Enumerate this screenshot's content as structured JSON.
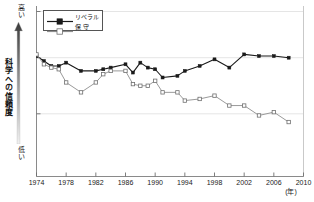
{
  "chart_data": {
    "type": "line",
    "title": "",
    "xlabel": "(年)",
    "ylabel": "科学への信頼度",
    "ylabel_high": "高い",
    "ylabel_low": "低い",
    "xlim": [
      1974,
      2010
    ],
    "ylim": [
      0,
      100
    ],
    "grid": true,
    "gridlines_y": [
      100,
      72,
      38
    ],
    "legend_position": "top-left",
    "xticks": [
      "1974",
      "1978",
      "1982",
      "1986",
      "1990",
      "1994",
      "1998",
      "2002",
      "2006",
      "2010"
    ],
    "xtick_values": [
      1974,
      1978,
      1982,
      1986,
      1990,
      1994,
      1998,
      2002,
      2006,
      2010
    ],
    "series": [
      {
        "name": "リベラル",
        "color": "#1a1a1a",
        "marker": "filled-square",
        "x": [
          1974,
          1975,
          1976,
          1977,
          1978,
          1980,
          1982,
          1983,
          1984,
          1986,
          1987,
          1988,
          1989,
          1990,
          1991,
          1993,
          1994,
          1996,
          1998,
          2000,
          2002,
          2004,
          2006,
          2008
        ],
        "values": [
          73,
          70,
          67,
          67,
          69,
          64,
          64,
          65,
          66,
          68,
          63,
          69,
          66,
          65,
          60,
          61,
          64,
          67,
          71,
          66,
          74,
          73,
          73,
          72
        ]
      },
      {
        "name": "保 守",
        "color": "#9a9a9a",
        "marker": "open-square",
        "x": [
          1974,
          1975,
          1976,
          1977,
          1978,
          1980,
          1982,
          1983,
          1984,
          1986,
          1987,
          1988,
          1989,
          1990,
          1991,
          1993,
          1994,
          1996,
          1998,
          2000,
          2002,
          2004,
          2006,
          2008
        ],
        "values": [
          74,
          68,
          66,
          65,
          57,
          51,
          57,
          62,
          64,
          64,
          56,
          55,
          55,
          58,
          51,
          51,
          46,
          47,
          49,
          43,
          43,
          37,
          39,
          33
        ]
      }
    ]
  },
  "legend": {
    "items": [
      {
        "label": "リベラル"
      },
      {
        "label": "保 守"
      }
    ]
  },
  "axis": {
    "y_title": "科学への信頼度",
    "y_high": "高い",
    "y_low": "低い",
    "x_unit": "(年)"
  }
}
